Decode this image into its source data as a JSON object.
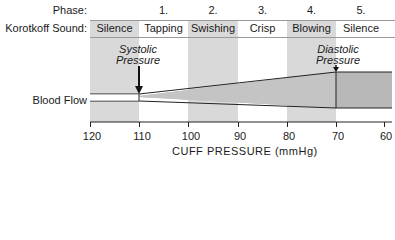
{
  "row_labels": {
    "phase": "Phase:",
    "sound": "Korotkoff Sound:",
    "flow": "Blood Flow"
  },
  "phases": [
    "1.",
    "2.",
    "3.",
    "4.",
    "5."
  ],
  "sounds": [
    "Silence",
    "Tapping",
    "Swishing",
    "Crisp",
    "Blowing",
    "Silence"
  ],
  "annotations": {
    "systolic": [
      "Systolic",
      "Pressure"
    ],
    "diastolic": [
      "Diastolic",
      "Pressure"
    ]
  },
  "axis": {
    "ticks": [
      "120",
      "110",
      "100",
      "90",
      "80",
      "70",
      "60"
    ],
    "title": "CUFF PRESSURE (mmHg)"
  },
  "colors": {
    "band": "#d9d9d9",
    "flow_fill": "#b8b8b8",
    "line": "#222222"
  }
}
